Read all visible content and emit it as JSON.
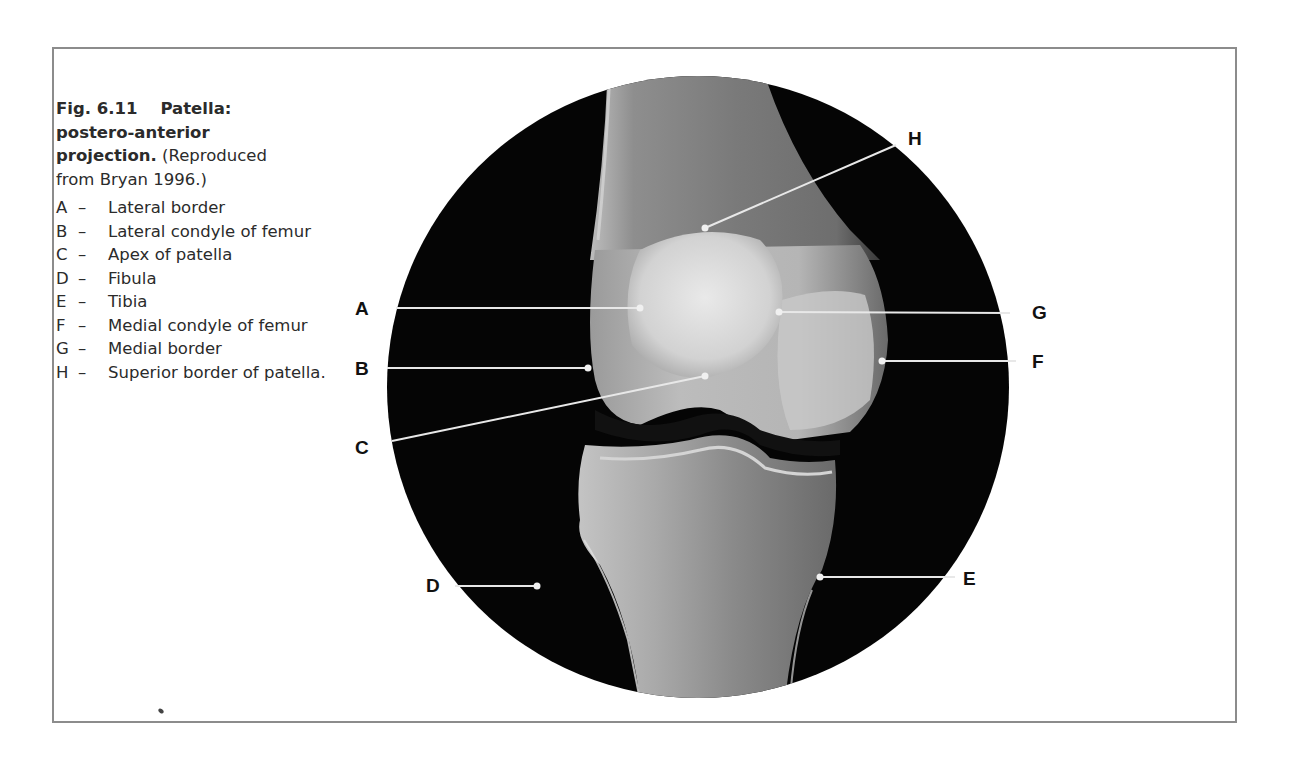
{
  "figure": {
    "number": "Fig. 6.11",
    "title_bold": "Patella: postero-anterior projection.",
    "title_line1_num": "Fig. 6.11",
    "title_line1_bold": "Patella:",
    "title_line2_bold": "postero-anterior",
    "title_line3_bold": "projection.",
    "title_line3_rest": " (Reproduced",
    "title_line4": "from Bryan 1996.)",
    "source": "Reproduced from Bryan 1996."
  },
  "legend": [
    {
      "letter": "A",
      "dash": "–",
      "text": "Lateral border"
    },
    {
      "letter": "B",
      "dash": "–",
      "text": "Lateral condyle of femur"
    },
    {
      "letter": "C",
      "dash": "–",
      "text": "Apex of patella"
    },
    {
      "letter": "D",
      "dash": "–",
      "text": "Fibula"
    },
    {
      "letter": "E",
      "dash": "–",
      "text": "Tibia"
    },
    {
      "letter": "F",
      "dash": "–",
      "text": "Medial condyle of femur"
    },
    {
      "letter": "G",
      "dash": "–",
      "text": "Medial border"
    },
    {
      "letter": "H",
      "dash": "–",
      "text": "Superior border of patella."
    }
  ],
  "image_labels": {
    "A": "A",
    "B": "B",
    "C": "C",
    "D": "D",
    "E": "E",
    "F": "F",
    "G": "G",
    "H": "H"
  },
  "colors": {
    "frame": "#8c8c8c",
    "xray_background": "#050505",
    "bone": "#d8d8d8",
    "leader_line": "#e6e6e6"
  }
}
